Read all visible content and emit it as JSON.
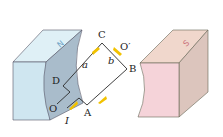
{
  "figure": {
    "magnets": {
      "north": {
        "label": "N",
        "face_color": "#cfe6f0",
        "top_color": "#dff0f6",
        "curve_color": "#a9bccb"
      },
      "south": {
        "label": "S",
        "face_color": "#f5d3d9",
        "top_color": "#f0d7cc",
        "side_color": "#dcc5bd"
      }
    },
    "coil_points": {
      "A": "A",
      "B": "B",
      "C": "C",
      "D": "D"
    },
    "axis_labels": {
      "O": "O",
      "O_prime": "O′"
    },
    "side_labels": {
      "a": "a",
      "b": "b"
    },
    "current_label": "I",
    "arrow_color": "#f2c200",
    "wire_color": "#2a2a2a"
  }
}
